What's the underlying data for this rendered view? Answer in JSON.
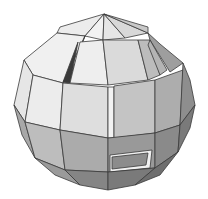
{
  "figure": {
    "background": "#ffffff",
    "edge_color": "#3a3a3a",
    "shades": {
      "lightest": "#f2f2f2",
      "light": "#e4e4e4",
      "mid_light": "#d2d2d2",
      "mid": "#bdbdbd",
      "mid_dark": "#a6a6a6",
      "dark": "#8e8e8e",
      "darkest": "#6e6e6e"
    }
  }
}
